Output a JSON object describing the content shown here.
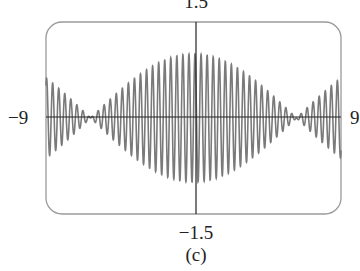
{
  "chart_data": {
    "type": "line",
    "title": "",
    "caption": "(c)",
    "function_description": "y ≈ cos(x/4) · sin(17x) — high-frequency oscillation modulated by a slow cosine envelope",
    "xlabel": "",
    "ylabel": "",
    "xlim": [
      -9,
      9
    ],
    "ylim": [
      -1.5,
      1.5
    ],
    "tick_labels": {
      "x_min": "−9",
      "x_max": "9",
      "y_min": "−1.5",
      "y_max": "1.5"
    },
    "carrier_frequency": 17,
    "envelope_frequency": 0.25,
    "envelope_peak": 1.0,
    "envelope_zeros": [
      -6.28,
      6.28
    ],
    "edge_amplitude": 0.63,
    "grid": false,
    "legend": null,
    "frame": "rounded-rectangle",
    "line_color": "#7a7a7a",
    "axis_color": "#222222",
    "frame_color": "#9a9a9a"
  }
}
